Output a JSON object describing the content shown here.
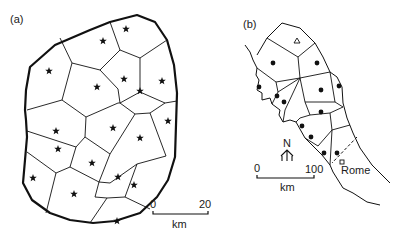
{
  "panel_a": {
    "label": "(a)",
    "scale": {
      "start": "0",
      "end": "20",
      "unit": "km"
    },
    "site_marker": "star-icon",
    "outline": "30,67 55,45 90,30 110,22 137,15 155,22 167,40 174,65 177,93 176,125 175,157 168,180 157,197 140,213 115,221 93,223 70,220 50,213 32,200 23,183 25,160 27,137 26,120 25,110 26,90",
    "edges": [
      "60,38 72,63",
      "72,63 62,100",
      "62,100 27,110",
      "110,22 120,50",
      "120,50 140,58",
      "140,58 167,40",
      "72,63 100,70",
      "100,70 120,50",
      "100,70 118,89",
      "118,89 120,103",
      "120,103 140,92",
      "140,92 140,58",
      "140,92 165,103",
      "165,103 177,101",
      "62,100 86,117",
      "86,117 118,103",
      "118,103 120,103",
      "120,103 135,114",
      "135,114 150,113",
      "150,113 165,103",
      "27,131 76,147",
      "86,117 85,137",
      "85,137 76,147",
      "85,137 110,154",
      "110,154 135,114",
      "150,113 166,156",
      "27,152 56,173",
      "56,173 70,167",
      "70,167 76,147",
      "70,167 99,182",
      "99,182 110,154",
      "99,182 110,183",
      "110,183 137,164",
      "137,164 166,156",
      "137,164 125,197",
      "125,197 150,209",
      "56,173 46,213",
      "99,182 95,197",
      "95,197 107,198",
      "107,198 125,197",
      "107,198 90,223"
    ],
    "stars": [
      [
        126,
        29
      ],
      [
        103,
        41
      ],
      [
        49,
        71
      ],
      [
        124,
        79
      ],
      [
        162,
        81
      ],
      [
        97,
        87
      ],
      [
        140,
        91
      ],
      [
        168,
        121
      ],
      [
        56,
        131
      ],
      [
        113,
        128
      ],
      [
        140,
        138
      ],
      [
        58,
        149
      ],
      [
        92,
        163
      ],
      [
        118,
        177
      ],
      [
        134,
        185
      ],
      [
        33,
        178
      ],
      [
        74,
        194
      ],
      [
        117,
        221
      ]
    ]
  },
  "panel_b": {
    "label": "(b)",
    "scale": {
      "start": "0",
      "end": "100",
      "unit": "km"
    },
    "north_label": "N",
    "city_label": "Rome",
    "center_marker": "triangle-icon",
    "site_marker": "dot-icon",
    "city_marker": "square-icon",
    "inland_boundary": "282,23 300,28 315,43 323,57 330,72 337,77 342,87 343,103 347,118 353,133 360,148 372,165 390,183",
    "coast": "245,45 250,52 253,60 257,68 256,75 259,80 257,90 262,93 262,100 270,98 272,104 280,110 279,115 283,122 290,120 296,122 305,138 315,148 322,155 330,165 333,172 343,188 353,193 367,202 380,205",
    "north_coast": "267,38 257,55",
    "top_edges": "257,55 267,38 282,23",
    "edges": [
      "267,38 298,57",
      "298,57 315,43",
      "298,57 300,78",
      "300,78 330,72",
      "257,68 276,82",
      "276,82 300,78",
      "300,78 305,102",
      "305,102 335,102",
      "335,102 330,72",
      "335,102 343,107",
      "300,78 278,92",
      "278,92 276,82",
      "278,92 272,104",
      "300,78 285,110",
      "285,110 283,122",
      "305,102 310,115",
      "310,115 300,118",
      "300,118 296,122",
      "310,115 330,113",
      "330,113 343,107",
      "330,113 332,130",
      "332,130 318,146",
      "318,146 305,138",
      "332,130 350,125",
      "332,130 330,165"
    ],
    "dashed": "357,137 332,163",
    "dots": [
      [
        273,
        63
      ],
      [
        317,
        63
      ],
      [
        259,
        87
      ],
      [
        321,
        90
      ],
      [
        339,
        86
      ],
      [
        277,
        96
      ],
      [
        284,
        102
      ],
      [
        321,
        112
      ],
      [
        302,
        126
      ],
      [
        311,
        137
      ],
      [
        324,
        153
      ],
      [
        337,
        153
      ]
    ],
    "triangle": [
      297,
      41
    ],
    "rome_square": [
      342,
      162
    ]
  }
}
